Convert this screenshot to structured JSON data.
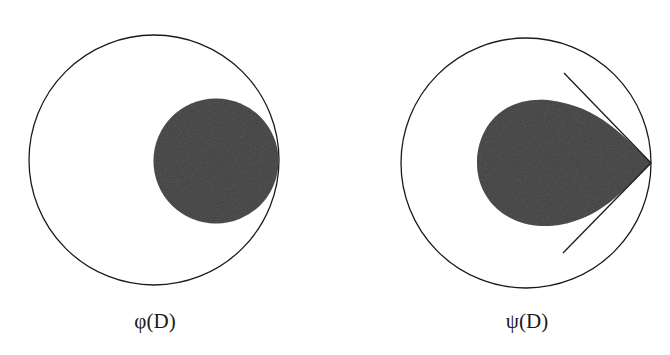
{
  "colors": {
    "background": "#ffffff",
    "stroke": "#1a1a1a",
    "fill_dark": "#3a3a3a"
  },
  "figures": [
    {
      "id": "phi",
      "caption": "φ(D)",
      "outer_circle": {
        "cx": 154,
        "cy": 160,
        "r": 125
      },
      "shape": "disc",
      "inner_disc": {
        "cx": 216,
        "cy": 161,
        "r": 62.5
      },
      "caption_pos": {
        "x": 155,
        "y": 308
      }
    },
    {
      "id": "psi",
      "caption": "ψ(D)",
      "outer_circle": {
        "cx": 526,
        "cy": 163,
        "r": 125
      },
      "shape": "teardrop",
      "teardrop": {
        "left_x": 477,
        "top_y": 100,
        "bottom_y": 226,
        "tip_x": 651,
        "tip_y": 163
      },
      "tangent_lines": [
        {
          "x1": 564,
          "y1": 73,
          "x2": 651,
          "y2": 163
        },
        {
          "x1": 563,
          "y1": 253,
          "x2": 651,
          "y2": 163
        }
      ],
      "caption_pos": {
        "x": 527,
        "y": 308
      }
    }
  ]
}
